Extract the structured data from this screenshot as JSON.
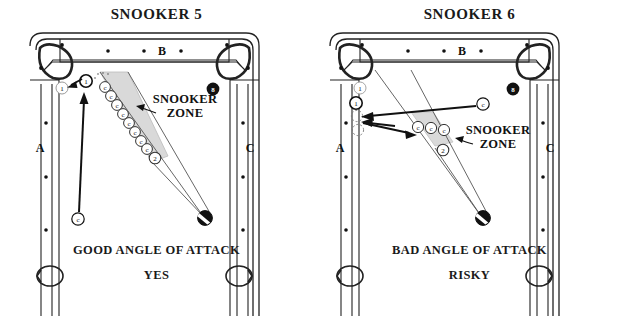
{
  "page": {
    "background": "#ffffff",
    "width": 626,
    "height": 316
  },
  "colors": {
    "ink": "#1a1a1a",
    "line": "#222222",
    "zone_fill": "#d9d9d9",
    "ball_fill": "#ffffff",
    "eight_ball": "#111111",
    "ghost": "#9a9a9a"
  },
  "panels": [
    {
      "id": "snooker-5",
      "title": "SNOOKER 5",
      "caption_main": "GOOD ANGLE OF ATTACK",
      "caption_verdict": "YES",
      "zone_label_line1": "SNOOKER",
      "zone_label_line2": "ZONE",
      "rail_labels": {
        "top": "B",
        "left": "A",
        "right": "C"
      },
      "top_rail_dots": 3,
      "side_rail_dots": 3,
      "eight_ball_label": "8",
      "balls": {
        "cue": {
          "label": "c",
          "x": 78,
          "y": 219
        },
        "object_one_ghost": {
          "label": "1",
          "x": 62,
          "y": 88
        },
        "object_one_solid": {
          "label": "1",
          "x": 85,
          "y": 81
        },
        "two_ball": {
          "label": "2",
          "x": 153,
          "y": 156
        },
        "target_black": {
          "label": "",
          "x": 205,
          "y": 218
        }
      },
      "blocker_chain": {
        "label": "c",
        "count": 8,
        "start": {
          "x": 101,
          "y": 86
        },
        "end": {
          "x": 148,
          "y": 148
        }
      }
    },
    {
      "id": "snooker-6",
      "title": "SNOOKER 6",
      "caption_main": "BAD ANGLE OF ATTACK",
      "caption_verdict": "RISKY",
      "zone_label_line1": "SNOOKER",
      "zone_label_line2": "ZONE",
      "rail_labels": {
        "top": "B",
        "left": "A",
        "right": "C"
      },
      "top_rail_dots": 3,
      "side_rail_dots": 3,
      "eight_ball_label": "8",
      "balls": {
        "cue": {
          "label": "c",
          "x": 170,
          "y": 104
        },
        "object_one_ghost": {
          "label": "1",
          "x": 46,
          "y": 87
        },
        "object_one_solid": {
          "label": "1",
          "x": 42,
          "y": 102
        },
        "two_ball": {
          "label": "2",
          "x": 128,
          "y": 149
        },
        "target_black": {
          "label": "",
          "x": 170,
          "y": 218
        }
      },
      "blocker_chain": {
        "label": "c",
        "count": 3,
        "start": {
          "x": 103,
          "y": 127
        },
        "end": {
          "x": 143,
          "y": 130
        }
      }
    }
  ]
}
